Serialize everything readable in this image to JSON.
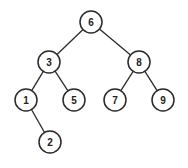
{
  "diagram": {
    "type": "binary-search-tree",
    "node_radius": 11,
    "colors": {
      "stroke": "#2a2a2a",
      "fill": "#ffffff",
      "text": "#222222",
      "background": "#ffffff"
    },
    "nodes": [
      {
        "id": "n6",
        "label": "6",
        "x": 91,
        "y": 22
      },
      {
        "id": "n3",
        "label": "3",
        "x": 49,
        "y": 62
      },
      {
        "id": "n8",
        "label": "8",
        "x": 139,
        "y": 62
      },
      {
        "id": "n1",
        "label": "1",
        "x": 26,
        "y": 100
      },
      {
        "id": "n5",
        "label": "5",
        "x": 74,
        "y": 100
      },
      {
        "id": "n7",
        "label": "7",
        "x": 115,
        "y": 100
      },
      {
        "id": "n9",
        "label": "9",
        "x": 163,
        "y": 100
      },
      {
        "id": "n2",
        "label": "2",
        "x": 50,
        "y": 142
      }
    ],
    "edges": [
      {
        "from": "n6",
        "to": "n3"
      },
      {
        "from": "n6",
        "to": "n8"
      },
      {
        "from": "n3",
        "to": "n1"
      },
      {
        "from": "n3",
        "to": "n5"
      },
      {
        "from": "n8",
        "to": "n7"
      },
      {
        "from": "n8",
        "to": "n9"
      },
      {
        "from": "n1",
        "to": "n2"
      }
    ]
  }
}
